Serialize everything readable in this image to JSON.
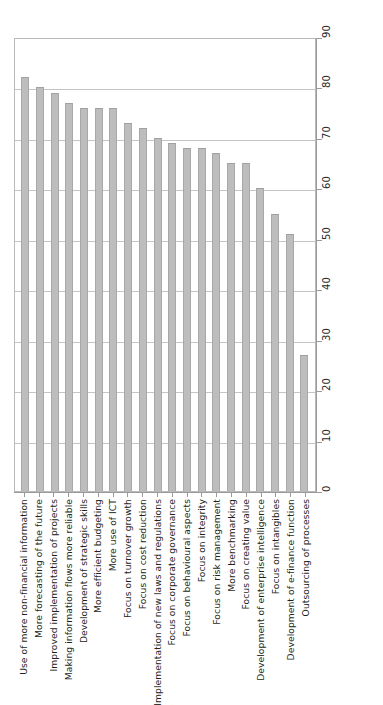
{
  "chart_data": {
    "type": "bar",
    "orientation": "vertical-bars-rotated-labels",
    "title": "",
    "subtitle": "",
    "xlabel": "",
    "ylabel": "",
    "ylim": [
      0,
      90
    ],
    "ytick_step": 10,
    "grid": true,
    "legend": false,
    "legend_position": "none",
    "bar_color": "#bdbdbd",
    "bar_edge_color": "#a8a8a8",
    "axis_color": "#9a9a9a",
    "gridline_color": "#c4c4c4",
    "yticks": [
      0,
      10,
      20,
      30,
      40,
      50,
      60,
      70,
      80,
      90
    ],
    "categories": [
      "Use of more non-financial information",
      "More forecasting of the future",
      "Improved implementation of projects",
      "Making information flows more reliable",
      "Development of strategic skills",
      "More efficient budgeting",
      "More use of ICT",
      "Focus on turnover growth",
      "Focus on cost reduction",
      "Implementation of new laws and regulations",
      "Focus on corporate governance",
      "Focus on behavioural aspects",
      "Focus on integrity",
      "Focus on risk management",
      "More benchmarking",
      "Focus on creating value",
      "Development of enterprise intelligence",
      "Focus on intangibles",
      "Development of e-finance function",
      "Outsourcing of processes"
    ],
    "values": [
      82,
      80,
      79,
      77,
      76,
      76,
      76,
      73,
      72,
      70,
      69,
      68,
      68,
      67,
      65,
      65,
      60,
      55,
      51,
      27
    ]
  }
}
